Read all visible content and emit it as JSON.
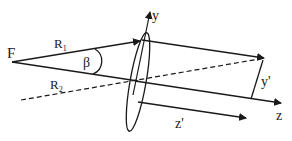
{
  "diagram": {
    "type": "optics-geometry",
    "labels": {
      "focus": "F",
      "ray1": "R",
      "ray1_sub": "1",
      "ray2": "R",
      "ray2_sub": "2",
      "angle": "β",
      "y_axis": "y",
      "z_axis": "z",
      "y_prime": "y'",
      "z_prime": "z'"
    },
    "colors": {
      "stroke": "#1a1a1a",
      "background": "#ffffff"
    }
  }
}
